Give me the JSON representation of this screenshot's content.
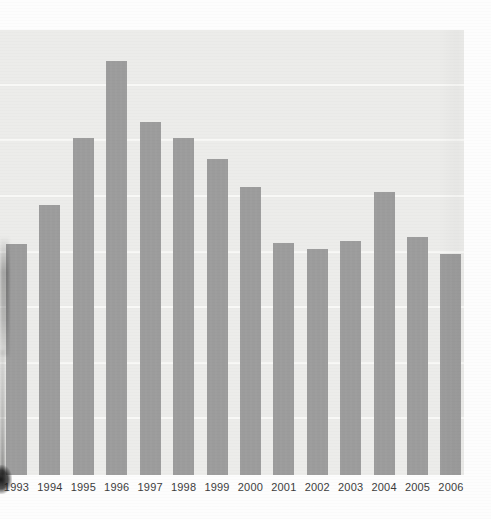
{
  "page": {
    "background": "#fdfdfd"
  },
  "chart_data": {
    "type": "bar",
    "title": "",
    "xlabel": "",
    "ylabel": "",
    "categories": [
      "1993",
      "1994",
      "1995",
      "1996",
      "1997",
      "1998",
      "1999",
      "2000",
      "2001",
      "2002",
      "2003",
      "2004",
      "2005",
      "2006"
    ],
    "values": [
      4.15,
      4.85,
      6.05,
      7.45,
      6.35,
      6.05,
      5.68,
      5.18,
      4.18,
      4.06,
      4.2,
      5.08,
      4.28,
      3.97
    ],
    "ylim": [
      0,
      8
    ],
    "grid": true,
    "gridline_values": [
      1,
      2,
      3,
      4,
      5,
      6,
      7
    ],
    "legend": "none",
    "y_axis_labels_visible": false,
    "bar_color": "#9c9c9c",
    "plot_bg": "#ececea",
    "gridline_color": "#f8f8f6",
    "label_color": "#3b3b3b"
  }
}
